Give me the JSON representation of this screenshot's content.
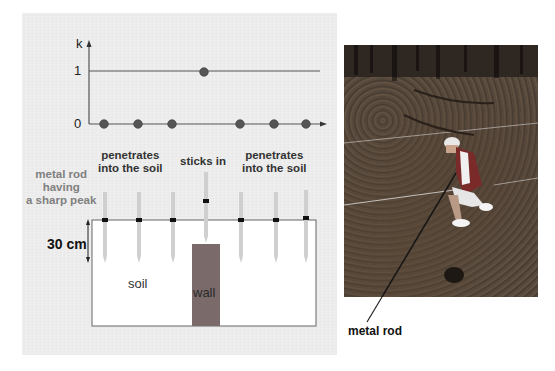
{
  "figure": {
    "left_panel": {
      "graph": {
        "y_axis_label": "k",
        "y_ticks": [
          "1",
          "0"
        ],
        "points": [
          {
            "position": 1,
            "k": 0
          },
          {
            "position": 2,
            "k": 0
          },
          {
            "position": 3,
            "k": 0
          },
          {
            "position": 4,
            "k": 1
          },
          {
            "position": 5,
            "k": 0
          },
          {
            "position": 6,
            "k": 0
          },
          {
            "position": 7,
            "k": 0
          }
        ]
      },
      "labels": {
        "rod_description": [
          "metal rod",
          "having",
          "a sharp peak"
        ],
        "left_group": [
          "penetrates",
          "into the soil"
        ],
        "center": "sticks in",
        "right_group": [
          "penetrates",
          "into the soil"
        ],
        "depth": "30 cm",
        "soil": "soil",
        "wall": "wall"
      },
      "colors": {
        "panel_bg": "#ececec",
        "dot": "#555555",
        "wall": "#7a6a6a",
        "rod": "#cfcfcf",
        "marker": "#111111"
      }
    },
    "right_panel": {
      "photo_description": "person crouching in forest pushing metal rod into leaf-covered soil",
      "callout_label": "metal rod"
    }
  }
}
